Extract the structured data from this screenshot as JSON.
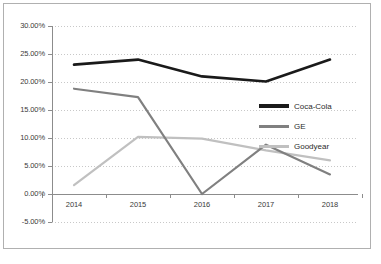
{
  "chart_data": {
    "type": "line",
    "title": "",
    "subtitle": "",
    "xlabel": "",
    "ylabel": "",
    "categories": [
      "2014",
      "2015",
      "2016",
      "2017",
      "2018"
    ],
    "ylim": [
      -5,
      30
    ],
    "ytick_labels": [
      "30.00%",
      "25.00%",
      "20.00%",
      "15.00%",
      "10.00%",
      "5.00%",
      "0.00%",
      "-5.00%"
    ],
    "ytick_values": [
      30,
      25,
      20,
      15,
      10,
      5,
      0,
      -5
    ],
    "grid": true,
    "grid_style": "dotted",
    "legend_position": "inside-right",
    "series": [
      {
        "name": "Coca-Cola",
        "color": "#1a1a1a",
        "width": 2.6,
        "values": [
          23.1,
          24.0,
          21.0,
          20.1,
          24.0
        ]
      },
      {
        "name": "GE",
        "color": "#808080",
        "width": 2.2,
        "values": [
          18.8,
          17.3,
          0.0,
          8.8,
          3.5
        ]
      },
      {
        "name": "Goodyear",
        "color": "#c0c0c0",
        "width": 2.2,
        "values": [
          1.6,
          10.2,
          9.9,
          7.8,
          6.0
        ]
      }
    ]
  },
  "legend": {
    "items": [
      {
        "label": "Coca-Cola"
      },
      {
        "label": "GE"
      },
      {
        "label": "Goodyear"
      }
    ]
  },
  "footer": {
    "note": ""
  },
  "colors": {
    "border": "#b0b0b0",
    "axis": "#8c8c8c",
    "grid": "#c8c8c8",
    "text": "#3a3a3a",
    "background": "#ffffff"
  }
}
